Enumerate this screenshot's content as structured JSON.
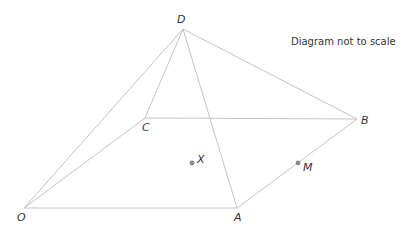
{
  "diagram": {
    "note": "Diagram not to scale",
    "colors": {
      "edge": "#c4c4c4",
      "point": "#8a8a8a",
      "text": "#333333"
    },
    "vertices": {
      "O": {
        "label": "O",
        "x": 24,
        "y": 208
      },
      "A": {
        "label": "A",
        "x": 237,
        "y": 208
      },
      "B": {
        "label": "B",
        "x": 357,
        "y": 119
      },
      "C": {
        "label": "C",
        "x": 145,
        "y": 118
      },
      "D": {
        "label": "D",
        "x": 183,
        "y": 29
      }
    },
    "points": {
      "X": {
        "label": "X"
      },
      "M": {
        "label": "M"
      }
    },
    "edges": [
      [
        "O",
        "A"
      ],
      [
        "A",
        "B"
      ],
      [
        "B",
        "C"
      ],
      [
        "C",
        "O"
      ],
      [
        "D",
        "O"
      ],
      [
        "D",
        "A"
      ],
      [
        "D",
        "B"
      ],
      [
        "D",
        "C"
      ]
    ]
  }
}
